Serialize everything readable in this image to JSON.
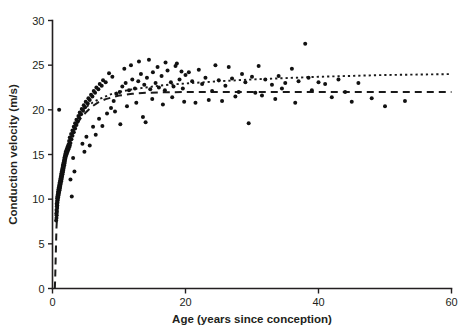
{
  "chart_data": {
    "type": "scatter",
    "title": "",
    "subtitle": "",
    "xlabel": "Age (years since conception)",
    "ylabel": "Conduction velocity (m/s)",
    "xlim": [
      0,
      60
    ],
    "ylim": [
      0,
      30
    ],
    "xticks": [
      0,
      20,
      40,
      60
    ],
    "yticks": [
      0,
      5,
      10,
      15,
      20,
      25,
      30
    ],
    "xtick_labels": [
      "0",
      "20",
      "40",
      "60"
    ],
    "ytick_labels": [
      "0",
      "5",
      "10",
      "15",
      "20",
      "25",
      "30"
    ],
    "grid": false,
    "legend": null,
    "legend_position": "none",
    "marker": "filled-circle",
    "marker_color": "#111111",
    "axis_color": "#231f20",
    "background_color": "#ffffff",
    "series": [
      {
        "name": "Conduction velocity observations",
        "type": "scatter",
        "points": [
          [
            0.55,
            7.6
          ],
          [
            0.6,
            7.9
          ],
          [
            0.62,
            8.2
          ],
          [
            0.58,
            8.4
          ],
          [
            0.65,
            8.6
          ],
          [
            0.6,
            8.8
          ],
          [
            0.7,
            9.0
          ],
          [
            0.66,
            9.2
          ],
          [
            0.72,
            9.3
          ],
          [
            0.63,
            9.5
          ],
          [
            0.75,
            9.6
          ],
          [
            0.68,
            9.8
          ],
          [
            0.8,
            9.9
          ],
          [
            0.7,
            10.1
          ],
          [
            0.85,
            10.2
          ],
          [
            0.74,
            10.3
          ],
          [
            0.9,
            10.4
          ],
          [
            0.78,
            10.5
          ],
          [
            0.95,
            10.6
          ],
          [
            0.82,
            10.7
          ],
          [
            1.0,
            10.8
          ],
          [
            0.86,
            10.9
          ],
          [
            1.05,
            11.0
          ],
          [
            0.9,
            11.1
          ],
          [
            1.1,
            11.2
          ],
          [
            0.95,
            11.3
          ],
          [
            1.15,
            11.4
          ],
          [
            1.0,
            11.5
          ],
          [
            1.2,
            11.6
          ],
          [
            1.05,
            11.7
          ],
          [
            1.25,
            11.8
          ],
          [
            1.1,
            11.9
          ],
          [
            1.3,
            12.0
          ],
          [
            1.15,
            12.1
          ],
          [
            1.35,
            12.2
          ],
          [
            1.2,
            12.3
          ],
          [
            1.4,
            12.4
          ],
          [
            1.25,
            12.5
          ],
          [
            1.45,
            12.6
          ],
          [
            1.3,
            12.7
          ],
          [
            1.5,
            12.8
          ],
          [
            1.35,
            12.9
          ],
          [
            1.55,
            13.0
          ],
          [
            1.4,
            13.1
          ],
          [
            1.6,
            13.2
          ],
          [
            1.45,
            13.3
          ],
          [
            1.65,
            13.4
          ],
          [
            1.5,
            13.5
          ],
          [
            1.7,
            13.6
          ],
          [
            1.55,
            13.7
          ],
          [
            1.75,
            13.8
          ],
          [
            1.6,
            13.9
          ],
          [
            1.8,
            14.0
          ],
          [
            1.68,
            14.1
          ],
          [
            1.85,
            14.2
          ],
          [
            1.72,
            14.3
          ],
          [
            1.9,
            14.4
          ],
          [
            1.78,
            14.5
          ],
          [
            1.95,
            14.6
          ],
          [
            1.82,
            14.7
          ],
          [
            2.0,
            14.8
          ],
          [
            1.88,
            14.9
          ],
          [
            2.1,
            15.0
          ],
          [
            1.95,
            15.1
          ],
          [
            2.2,
            15.2
          ],
          [
            2.0,
            15.3
          ],
          [
            2.3,
            15.4
          ],
          [
            2.1,
            15.5
          ],
          [
            2.4,
            15.6
          ],
          [
            2.2,
            15.7
          ],
          [
            2.5,
            15.8
          ],
          [
            2.3,
            15.9
          ],
          [
            2.6,
            16.0
          ],
          [
            2.4,
            16.1
          ],
          [
            2.7,
            16.3
          ],
          [
            2.5,
            16.5
          ],
          [
            2.85,
            16.7
          ],
          [
            2.6,
            16.9
          ],
          [
            3.0,
            17.1
          ],
          [
            2.8,
            17.3
          ],
          [
            3.2,
            17.5
          ],
          [
            3.0,
            17.7
          ],
          [
            3.4,
            17.9
          ],
          [
            3.2,
            18.1
          ],
          [
            3.6,
            18.3
          ],
          [
            3.4,
            18.5
          ],
          [
            3.8,
            18.7
          ],
          [
            3.6,
            18.9
          ],
          [
            4.0,
            19.1
          ],
          [
            3.9,
            19.3
          ],
          [
            4.3,
            19.5
          ],
          [
            4.1,
            19.7
          ],
          [
            4.6,
            19.9
          ],
          [
            4.4,
            20.1
          ],
          [
            4.9,
            20.3
          ],
          [
            4.7,
            20.5
          ],
          [
            5.3,
            20.7
          ],
          [
            5.0,
            20.9
          ],
          [
            5.6,
            21.1
          ],
          [
            5.4,
            21.3
          ],
          [
            6.0,
            21.5
          ],
          [
            5.8,
            21.7
          ],
          [
            6.4,
            21.9
          ],
          [
            6.2,
            22.1
          ],
          [
            6.9,
            22.3
          ],
          [
            6.6,
            22.5
          ],
          [
            7.4,
            22.7
          ],
          [
            7.1,
            22.9
          ],
          [
            8.0,
            23.1
          ],
          [
            7.6,
            23.3
          ],
          [
            1.0,
            20.0
          ],
          [
            2.9,
            10.3
          ],
          [
            3.1,
            14.6
          ],
          [
            3.3,
            13.1
          ],
          [
            2.7,
            12.2
          ],
          [
            4.5,
            16.2
          ],
          [
            4.8,
            15.3
          ],
          [
            5.1,
            17.0
          ],
          [
            5.6,
            16.0
          ],
          [
            6.1,
            18.1
          ],
          [
            6.5,
            17.2
          ],
          [
            7.0,
            19.0
          ],
          [
            7.5,
            18.2
          ],
          [
            8.2,
            19.6
          ],
          [
            8.8,
            20.2
          ],
          [
            9.2,
            21.0
          ],
          [
            9.6,
            21.8
          ],
          [
            10.1,
            22.0
          ],
          [
            10.5,
            22.6
          ],
          [
            11.0,
            23.0
          ],
          [
            11.5,
            22.2
          ],
          [
            12.0,
            23.4
          ],
          [
            12.4,
            22.4
          ],
          [
            12.9,
            23.2
          ],
          [
            13.3,
            24.0
          ],
          [
            13.8,
            22.8
          ],
          [
            14.2,
            23.6
          ],
          [
            14.7,
            22.3
          ],
          [
            15.1,
            24.2
          ],
          [
            15.5,
            23.0
          ],
          [
            16.0,
            22.5
          ],
          [
            16.4,
            23.8
          ],
          [
            16.9,
            22.2
          ],
          [
            17.3,
            24.4
          ],
          [
            17.8,
            23.1
          ],
          [
            18.2,
            22.6
          ],
          [
            18.7,
            25.2
          ],
          [
            19.1,
            23.4
          ],
          [
            19.6,
            22.4
          ],
          [
            20.0,
            23.9
          ],
          [
            8.5,
            24.1
          ],
          [
            9.0,
            23.7
          ],
          [
            10.8,
            24.6
          ],
          [
            11.8,
            25.0
          ],
          [
            13.0,
            25.4
          ],
          [
            14.5,
            25.6
          ],
          [
            15.8,
            24.8
          ],
          [
            17.0,
            25.3
          ],
          [
            18.5,
            24.9
          ],
          [
            19.4,
            24.3
          ],
          [
            9.4,
            19.8
          ],
          [
            10.2,
            18.4
          ],
          [
            11.2,
            20.4
          ],
          [
            12.6,
            20.8
          ],
          [
            13.6,
            19.2
          ],
          [
            15.0,
            21.2
          ],
          [
            16.6,
            20.6
          ],
          [
            18.0,
            21.4
          ],
          [
            19.8,
            20.9
          ],
          [
            14.0,
            18.6
          ],
          [
            21.0,
            23.2
          ],
          [
            22.0,
            24.5
          ],
          [
            22.5,
            22.9
          ],
          [
            23.0,
            23.6
          ],
          [
            24.0,
            22.1
          ],
          [
            24.5,
            25.0
          ],
          [
            25.0,
            23.3
          ],
          [
            26.0,
            22.7
          ],
          [
            26.5,
            24.8
          ],
          [
            27.0,
            23.5
          ],
          [
            28.0,
            22.0
          ],
          [
            28.5,
            24.0
          ],
          [
            29.0,
            23.1
          ],
          [
            30.0,
            23.7
          ],
          [
            30.5,
            21.9
          ],
          [
            31.0,
            24.9
          ],
          [
            32.0,
            23.4
          ],
          [
            33.0,
            22.8
          ],
          [
            34.0,
            23.8
          ],
          [
            35.0,
            23.0
          ],
          [
            36.0,
            24.6
          ],
          [
            37.0,
            23.2
          ],
          [
            38.0,
            27.4
          ],
          [
            38.5,
            23.6
          ],
          [
            39.0,
            22.2
          ],
          [
            40.0,
            23.1
          ],
          [
            41.0,
            22.9
          ],
          [
            42.0,
            21.4
          ],
          [
            43.0,
            23.4
          ],
          [
            44.0,
            22.0
          ],
          [
            45.0,
            20.9
          ],
          [
            46.0,
            23.0
          ],
          [
            48.0,
            21.3
          ],
          [
            50.0,
            20.4
          ],
          [
            53.0,
            21.0
          ],
          [
            21.5,
            20.8
          ],
          [
            23.5,
            21.1
          ],
          [
            27.5,
            21.5
          ],
          [
            29.5,
            18.5
          ],
          [
            25.5,
            21.0
          ],
          [
            33.5,
            21.2
          ],
          [
            36.5,
            20.8
          ],
          [
            20.5,
            24.2
          ],
          [
            31.5,
            21.6
          ],
          [
            34.5,
            22.4
          ]
        ]
      }
    ],
    "fits": [
      {
        "name": "exponential fit (asymptote 22)",
        "style": "dashed",
        "asymptote": 22.0,
        "points": [
          [
            0.35,
            0.0
          ],
          [
            0.4,
            1.0
          ],
          [
            0.45,
            2.5
          ],
          [
            0.5,
            4.0
          ],
          [
            0.55,
            5.5
          ],
          [
            0.6,
            6.8
          ],
          [
            0.7,
            8.2
          ],
          [
            0.8,
            9.4
          ],
          [
            0.9,
            10.3
          ],
          [
            1.0,
            11.1
          ],
          [
            1.2,
            12.3
          ],
          [
            1.4,
            13.2
          ],
          [
            1.6,
            14.0
          ],
          [
            1.8,
            14.7
          ],
          [
            2.0,
            15.3
          ],
          [
            2.5,
            16.5
          ],
          [
            3.0,
            17.4
          ],
          [
            3.5,
            18.2
          ],
          [
            4.0,
            18.8
          ],
          [
            4.5,
            19.3
          ],
          [
            5.0,
            19.7
          ],
          [
            6.0,
            20.4
          ],
          [
            7.0,
            20.9
          ],
          [
            8.0,
            21.2
          ],
          [
            9.0,
            21.4
          ],
          [
            10.0,
            21.6
          ],
          [
            12.0,
            21.8
          ],
          [
            14.0,
            21.9
          ],
          [
            16.0,
            21.95
          ],
          [
            20.0,
            22.0
          ],
          [
            30.0,
            22.0
          ],
          [
            40.0,
            22.0
          ],
          [
            50.0,
            22.0
          ],
          [
            60.0,
            22.0
          ]
        ]
      },
      {
        "name": "fit with linear term (rising)",
        "style": "dotted",
        "points": [
          [
            4.0,
            19.6
          ],
          [
            5.0,
            20.3
          ],
          [
            6.0,
            20.8
          ],
          [
            7.0,
            21.2
          ],
          [
            8.0,
            21.5
          ],
          [
            9.0,
            21.8
          ],
          [
            10.0,
            22.0
          ],
          [
            12.0,
            22.3
          ],
          [
            14.0,
            22.5
          ],
          [
            16.0,
            22.7
          ],
          [
            18.0,
            22.85
          ],
          [
            20.0,
            22.95
          ],
          [
            25.0,
            23.2
          ],
          [
            30.0,
            23.4
          ],
          [
            35.0,
            23.55
          ],
          [
            40.0,
            23.7
          ],
          [
            45.0,
            23.8
          ],
          [
            50.0,
            23.9
          ],
          [
            55.0,
            23.95
          ],
          [
            60.0,
            24.0
          ]
        ]
      }
    ]
  }
}
